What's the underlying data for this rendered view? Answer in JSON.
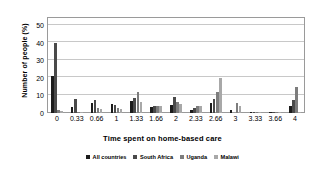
{
  "chart_data": {
    "type": "bar",
    "title": "",
    "xlabel": "Time spent on home-based care",
    "ylabel": "Number of  people (%)",
    "ylim": [
      0,
      55
    ],
    "yticks": [
      0,
      10,
      20,
      30,
      40,
      50
    ],
    "grid": true,
    "legend_position": "bottom",
    "categories": [
      "0",
      "0.33",
      "0.66",
      "1",
      "1.33",
      "1.66",
      "2",
      "2.33",
      "2.66",
      "3",
      "3.33",
      "3.66",
      "4"
    ],
    "series": [
      {
        "name": "All countries",
        "color": "#1c1c1c",
        "values": [
          21,
          3.5,
          5.5,
          5,
          7,
          3.5,
          4.5,
          2,
          5.5,
          1.5,
          0.6,
          0.5,
          4
        ]
      },
      {
        "name": "South Africa",
        "color": "#4a4a4a",
        "values": [
          40,
          8,
          7.5,
          4.5,
          8.5,
          4,
          9,
          3,
          8,
          0,
          0.8,
          0.3,
          7.5
        ]
      },
      {
        "name": "Uganda",
        "color": "#7d7d7d",
        "values": [
          2,
          0.5,
          3,
          3,
          12,
          4,
          6.5,
          4,
          12,
          5.5,
          0.5,
          0.6,
          15
        ]
      },
      {
        "name": "Malawi",
        "color": "#a8a8a8",
        "values": [
          1,
          0.4,
          2.5,
          2.5,
          6.5,
          4,
          5,
          4,
          20,
          4,
          0.5,
          0.5,
          0.8
        ]
      }
    ]
  },
  "legend": {
    "items": [
      {
        "label": "All countries"
      },
      {
        "label": "South Africa"
      },
      {
        "label": "Uganda"
      },
      {
        "label": "Malawi"
      }
    ]
  }
}
